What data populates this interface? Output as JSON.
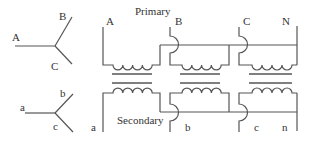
{
  "diagram": {
    "type": "three-phase wye-wye transformer connection",
    "primary_star": {
      "labels": [
        "A",
        "B",
        "C"
      ]
    },
    "secondary_star": {
      "labels": [
        "a",
        "b",
        "c"
      ]
    },
    "primary": {
      "title": "Primary",
      "terminals": [
        "A",
        "B",
        "C",
        "N"
      ]
    },
    "secondary": {
      "title": "Secondary",
      "terminals": [
        "a",
        "b",
        "c",
        "n"
      ]
    },
    "colors": {
      "line": "#555555",
      "text": "#333333",
      "background": "#ffffff"
    }
  }
}
